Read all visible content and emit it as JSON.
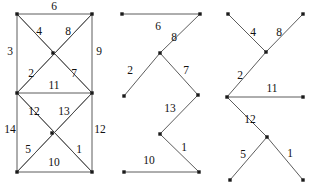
{
  "diagram": {
    "stroke_color": "#4a4a4a",
    "vertex_color": "#1a1a1a",
    "label_color": "#111111",
    "background": "#ffffff",
    "figures": [
      {
        "id": "figure-left",
        "name": "complete-weighted-graph",
        "vertices": [
          {
            "id": "tl",
            "x": 17,
            "y": 14
          },
          {
            "id": "tr",
            "x": 92,
            "y": 14
          },
          {
            "id": "cu",
            "x": 53,
            "y": 53
          },
          {
            "id": "ml",
            "x": 17,
            "y": 93
          },
          {
            "id": "mr",
            "x": 92,
            "y": 93
          },
          {
            "id": "cl",
            "x": 52,
            "y": 133
          },
          {
            "id": "bl",
            "x": 17,
            "y": 172
          },
          {
            "id": "br",
            "x": 92,
            "y": 172
          }
        ],
        "edges": [
          {
            "from": "tl",
            "to": "tr",
            "weight": "6",
            "lx": 54,
            "ly": 7
          },
          {
            "from": "tl",
            "to": "ml",
            "weight": "3",
            "lx": 10,
            "ly": 52
          },
          {
            "from": "tr",
            "to": "mr",
            "weight": "9",
            "lx": 99,
            "ly": 52
          },
          {
            "from": "tl",
            "to": "mr",
            "weight": "4",
            "lx": 39,
            "ly": 32
          },
          {
            "from": "tr",
            "to": "ml",
            "weight": "8",
            "lx": 68,
            "ly": 32
          },
          {
            "from": "ml",
            "to": "tr",
            "weight": "2",
            "lx": 31,
            "ly": 74
          },
          {
            "from": "mr",
            "to": "tl",
            "weight": "7",
            "lx": 74,
            "ly": 74
          },
          {
            "from": "ml",
            "to": "mr",
            "weight": "11",
            "lx": 54,
            "ly": 86
          },
          {
            "from": "ml",
            "to": "br",
            "weight": "12",
            "lx": 34,
            "ly": 112
          },
          {
            "from": "mr",
            "to": "bl",
            "weight": "13",
            "lx": 64,
            "ly": 112
          },
          {
            "from": "ml",
            "to": "bl",
            "weight": "14",
            "lx": 10,
            "ly": 130
          },
          {
            "from": "mr",
            "to": "br",
            "weight": "12",
            "lx": 100,
            "ly": 130
          },
          {
            "from": "bl",
            "to": "mr",
            "weight": "5",
            "lx": 28,
            "ly": 150
          },
          {
            "from": "br",
            "to": "ml",
            "weight": "1",
            "lx": 79,
            "ly": 150
          },
          {
            "from": "bl",
            "to": "br",
            "weight": "10",
            "lx": 54,
            "ly": 163
          }
        ]
      },
      {
        "id": "figure-middle",
        "name": "zigzag-path-tree",
        "vertices": [
          {
            "id": "m_tl",
            "x": 122,
            "y": 14
          },
          {
            "id": "m_tr",
            "x": 200,
            "y": 14
          },
          {
            "id": "m_apex",
            "x": 160,
            "y": 53
          },
          {
            "id": "m_ml",
            "x": 124,
            "y": 96
          },
          {
            "id": "m_mr",
            "x": 198,
            "y": 95
          },
          {
            "id": "m_kn",
            "x": 160,
            "y": 134
          },
          {
            "id": "m_bl",
            "x": 124,
            "y": 172
          },
          {
            "id": "m_br",
            "x": 199,
            "y": 172
          }
        ],
        "edges": [
          {
            "from": "m_tl",
            "to": "m_tr",
            "weight": "6",
            "lx": 158,
            "ly": 27
          },
          {
            "from": "m_tr",
            "to": "m_apex",
            "weight": "8",
            "lx": 174,
            "ly": 38
          },
          {
            "from": "m_apex",
            "to": "m_ml",
            "weight": "2",
            "lx": 130,
            "ly": 71
          },
          {
            "from": "m_apex",
            "to": "m_mr",
            "weight": "7",
            "lx": 186,
            "ly": 71
          },
          {
            "from": "m_mr",
            "to": "m_kn",
            "weight": "13",
            "lx": 170,
            "ly": 109
          },
          {
            "from": "m_kn",
            "to": "m_br",
            "weight": "1",
            "lx": 184,
            "ly": 148
          },
          {
            "from": "m_bl",
            "to": "m_br",
            "weight": "10",
            "lx": 149,
            "ly": 161
          }
        ]
      },
      {
        "id": "figure-right",
        "name": "star-path-tree",
        "vertices": [
          {
            "id": "r_tl",
            "x": 228,
            "y": 14
          },
          {
            "id": "r_tr",
            "x": 303,
            "y": 14
          },
          {
            "id": "r_apex",
            "x": 266,
            "y": 52
          },
          {
            "id": "r_hub",
            "x": 227,
            "y": 97
          },
          {
            "id": "r_mr",
            "x": 303,
            "y": 97
          },
          {
            "id": "r_kn",
            "x": 267,
            "y": 137
          },
          {
            "id": "r_bl",
            "x": 230,
            "y": 180
          },
          {
            "id": "r_br",
            "x": 303,
            "y": 180
          }
        ],
        "edges": [
          {
            "from": "r_tl",
            "to": "r_apex",
            "weight": "4",
            "lx": 253,
            "ly": 33
          },
          {
            "from": "r_tr",
            "to": "r_apex",
            "weight": "8",
            "lx": 279,
            "ly": 33
          },
          {
            "from": "r_apex",
            "to": "r_hub",
            "weight": "2",
            "lx": 240,
            "ly": 76
          },
          {
            "from": "r_hub",
            "to": "r_mr",
            "weight": "11",
            "lx": 272,
            "ly": 89
          },
          {
            "from": "r_hub",
            "to": "r_kn",
            "weight": "12",
            "lx": 250,
            "ly": 120
          },
          {
            "from": "r_kn",
            "to": "r_bl",
            "weight": "5",
            "lx": 243,
            "ly": 155
          },
          {
            "from": "r_kn",
            "to": "r_br",
            "weight": "1",
            "lx": 290,
            "ly": 154
          }
        ]
      }
    ]
  }
}
